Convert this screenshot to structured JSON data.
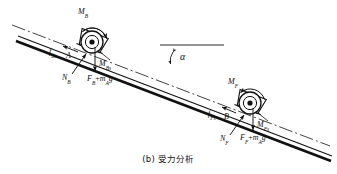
{
  "figure": {
    "caption": "(b) 受力分析",
    "caption_prefix": "(b)",
    "caption_text": "受力分析",
    "incline_angle_symbol": "α",
    "colors": {
      "line": "#111111",
      "background": "#ffffff",
      "text": "#111111"
    }
  },
  "labels": {
    "moment_top_roller": {
      "base": "M",
      "sub": "B"
    },
    "friction_top": {
      "base": "f",
      "sub": "Bs"
    },
    "point_top": {
      "base": "A",
      "sub": ""
    },
    "normal_top": {
      "base": "N",
      "sub": "B"
    },
    "moment_support_top": {
      "base": "M",
      "sub": "Bs"
    },
    "load_top": {
      "base": "F",
      "sub": "B",
      "op": "+",
      "mass": "m",
      "mass_sub": "A",
      "g": "g"
    },
    "moment_bottom_roller": {
      "base": "M",
      "sub": "F"
    },
    "friction_bottom": {
      "base": "f",
      "sub": "Fs"
    },
    "point_bottom": {
      "base": "B",
      "sub": ""
    },
    "normal_bottom": {
      "base": "N",
      "sub": "F"
    },
    "moment_support_bottom": {
      "base": "M",
      "sub": "Fs"
    },
    "load_bottom": {
      "base": "F",
      "sub": "F",
      "op": "+",
      "mass": "m",
      "mass_sub": "A",
      "g": "g"
    },
    "angle": "α"
  },
  "geometry": {
    "incline_angle_deg": 21,
    "roller_top": {
      "cx": 92,
      "cy": 42,
      "r": 11
    },
    "roller_bottom": {
      "cx": 250,
      "cy": 103,
      "r": 11
    },
    "horizontal_ray": {
      "x1": 164,
      "y1": 45,
      "x2": 222,
      "y2": 45
    }
  }
}
